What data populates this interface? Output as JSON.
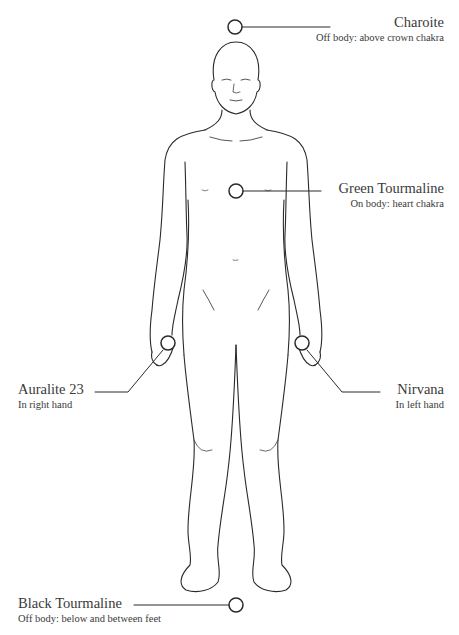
{
  "diagram": {
    "stroke_color": "#2a2a2a",
    "background": "#ffffff",
    "placements": [
      {
        "id": "charoite",
        "name": "Charoite",
        "position": "Off body: above crown chakra",
        "marker": {
          "x": 235,
          "y": 27
        }
      },
      {
        "id": "green-tourmaline",
        "name": "Green Tourmaline",
        "position": "On body: heart chakra",
        "marker": {
          "x": 236,
          "y": 191
        }
      },
      {
        "id": "auralite-23",
        "name": "Auralite 23",
        "position": "In right hand",
        "marker": {
          "x": 168,
          "y": 343
        }
      },
      {
        "id": "nirvana",
        "name": "Nirvana",
        "position": "In left hand",
        "marker": {
          "x": 302,
          "y": 343
        }
      },
      {
        "id": "black-tourmaline",
        "name": "Black Tourmaline",
        "position": "Off body: below and between feet",
        "marker": {
          "x": 236,
          "y": 605
        }
      }
    ]
  }
}
